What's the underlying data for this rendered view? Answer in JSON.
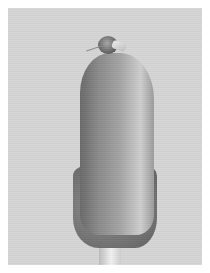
{
  "image": {
    "description": "Grayscale micrograph of an elongated biological specimen on a stalk, small head structure at top",
    "colors": {
      "background": "#d6d6d6",
      "border": "#ffffff",
      "specimen_shadow": "#6a6a6a",
      "specimen_highlight": "#cfcfcf"
    }
  }
}
